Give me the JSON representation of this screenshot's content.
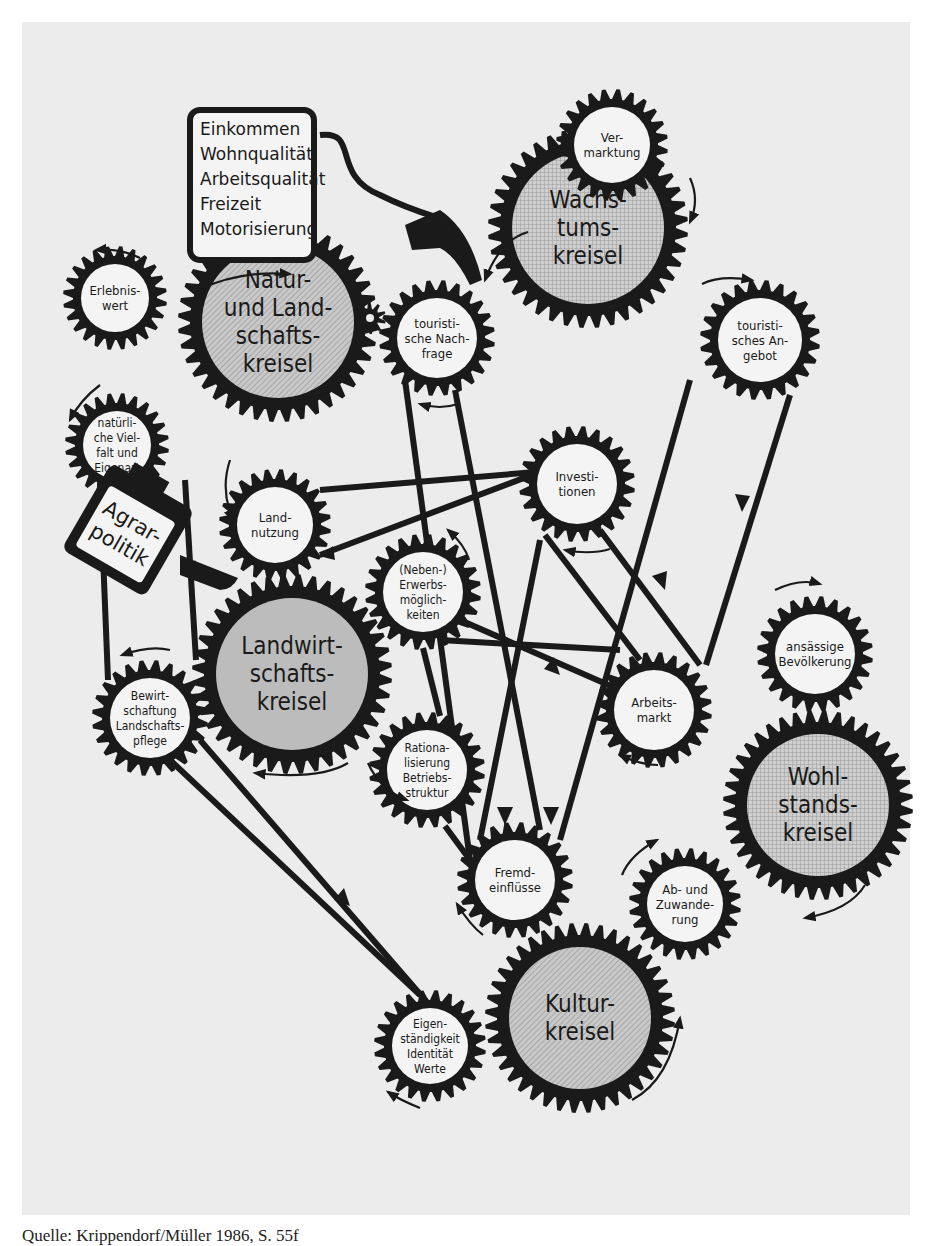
{
  "colors": {
    "background": "#ececec",
    "ink": "#1a1a1a",
    "gear_face": "#f4f4f4",
    "main_gear_face": "#bdbdbd"
  },
  "info_box": {
    "lines": [
      "Einkommen",
      "Wohnqualität",
      "Arbeitsqualität",
      "Freizeit",
      "Motorisierung"
    ]
  },
  "agrarpolitik": {
    "lines": [
      "Agrar-",
      "politik"
    ]
  },
  "gears": [
    {
      "id": "natur",
      "label": [
        "Natur-",
        "und Land-",
        "schafts-",
        "kreisel"
      ],
      "cx": 278,
      "cy": 322,
      "r": 100,
      "main": true
    },
    {
      "id": "wachstum",
      "label": [
        "Wachs-",
        "tums-",
        "kreisel"
      ],
      "cx": 588,
      "cy": 228,
      "r": 100,
      "main": true
    },
    {
      "id": "landwirtschaft",
      "label": [
        "Landwirt-",
        "schafts-",
        "kreisel"
      ],
      "cx": 292,
      "cy": 674,
      "r": 100,
      "main": true
    },
    {
      "id": "wohlstand",
      "label": [
        "Wohl-",
        "stands-",
        "kreisel"
      ],
      "cx": 818,
      "cy": 805,
      "r": 95,
      "main": true
    },
    {
      "id": "kultur",
      "label": [
        "Kultur-",
        "kreisel"
      ],
      "cx": 580,
      "cy": 1018,
      "r": 95,
      "main": true
    },
    {
      "id": "erlebniswert",
      "label": [
        "Erlebnis-",
        "wert"
      ],
      "cx": 115,
      "cy": 298,
      "r": 52,
      "main": false
    },
    {
      "id": "vielfalt",
      "label": [
        "natürli-",
        "che Viel-",
        "falt und",
        "Eigenart"
      ],
      "cx": 117,
      "cy": 445,
      "r": 52,
      "main": false
    },
    {
      "id": "vermarktung",
      "label": [
        "Ver-",
        "marktung"
      ],
      "cx": 612,
      "cy": 200,
      "r": 56,
      "main": false,
      "override_cy": 145
    },
    {
      "id": "nachfrage",
      "label": [
        "touristi-",
        "sche Nach-",
        "frage"
      ],
      "cx": 437,
      "cy": 338,
      "r": 58,
      "main": false
    },
    {
      "id": "angebot",
      "label": [
        "touristi-",
        "sches An-",
        "gebot"
      ],
      "cx": 760,
      "cy": 340,
      "r": 60,
      "main": false
    },
    {
      "id": "investitionen",
      "label": [
        "Investi-",
        "tionen"
      ],
      "cx": 577,
      "cy": 484,
      "r": 58,
      "main": false
    },
    {
      "id": "landnutzung",
      "label": [
        "Land-",
        "nutzung"
      ],
      "cx": 275,
      "cy": 525,
      "r": 56,
      "main": false
    },
    {
      "id": "nebenerwerb",
      "label": [
        "(Neben-)",
        "Erwerbs-",
        "möglich-",
        "keiten"
      ],
      "cx": 423,
      "cy": 592,
      "r": 58,
      "main": false
    },
    {
      "id": "bewirtschaftung",
      "label": [
        "Bewirt-",
        "schaftung",
        "Landschafts-",
        "pflege"
      ],
      "cx": 150,
      "cy": 718,
      "r": 58,
      "main": false
    },
    {
      "id": "rationalisierung",
      "label": [
        "Rationa-",
        "lisierung",
        "Betriebs-",
        "struktur"
      ],
      "cx": 427,
      "cy": 770,
      "r": 58,
      "main": false
    },
    {
      "id": "arbeitsmarkt",
      "label": [
        "Arbeits-",
        "markt"
      ],
      "cx": 654,
      "cy": 710,
      "r": 58,
      "main": false
    },
    {
      "id": "bevoelkerung",
      "label": [
        "ansässige",
        "Bevölkerung"
      ],
      "cx": 815,
      "cy": 654,
      "r": 58,
      "main": false
    },
    {
      "id": "fremdeinfluesse",
      "label": [
        "Fremd-",
        "einflüsse"
      ],
      "cx": 515,
      "cy": 880,
      "r": 58,
      "main": false
    },
    {
      "id": "abzuwanderung",
      "label": [
        "Ab- und",
        "Zuwande-",
        "rung"
      ],
      "cx": 685,
      "cy": 904,
      "r": 56,
      "main": false
    },
    {
      "id": "eigenstaendigkeit",
      "label": [
        "Eigen-",
        "ständigkeit",
        "Identität",
        "Werte"
      ],
      "cx": 430,
      "cy": 1046,
      "r": 56,
      "main": false
    }
  ],
  "caption": "Quelle: Krippendorf/Müller 1986, S. 55f"
}
